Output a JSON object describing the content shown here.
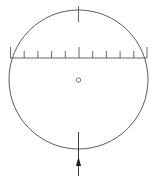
{
  "figure": {
    "background_color": "#ffffff",
    "line_color": "#4a4a4a",
    "accent_color": "#1f1f1f",
    "width": 157,
    "height": 179
  },
  "circle": {
    "name": "outer-circle",
    "center_x": 78.5,
    "center_y": 79.5,
    "radius": 69.5
  },
  "center_marker": {
    "name": "center-point-marker",
    "center_x": 78.5,
    "center_y": 80,
    "radius": 2.2
  },
  "top_tick": {
    "name": "top-index-tick",
    "x": 78.5,
    "y_start": 6,
    "y_end": 22
  },
  "scale": {
    "name": "horizontal-scale",
    "y": 58,
    "x_start": 10,
    "x_end": 147,
    "tick_count": 11,
    "tick_length_long": 11,
    "tick_length_short": 7,
    "tick_positions": [
      10.5,
      24.2,
      37.9,
      51.6,
      65.3,
      79.0,
      92.7,
      106.4,
      120.1,
      133.8,
      147.0
    ],
    "long_tick_indices": [
      0,
      5,
      10
    ]
  },
  "bottom_arrow": {
    "name": "bottom-pointer-arrow",
    "x": 78.5,
    "shaft_top_y": 132,
    "shaft_bottom_y": 176,
    "head_tip_y": 157,
    "head_base_y": 166,
    "head_half_width": 2.6,
    "direction": "up"
  },
  "chart_data": {
    "type": "diagram",
    "elements": [
      "outer-circle",
      "horizontal-scale-line",
      "scale-tick-marks",
      "top-index-tick",
      "center-point-marker",
      "bottom-pointer-arrow"
    ],
    "scale_tick_count": 11,
    "scale_axis_y": 58,
    "grid": false,
    "legend": "none"
  }
}
